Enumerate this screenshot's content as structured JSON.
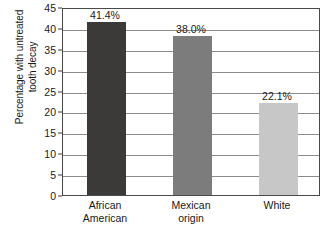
{
  "chart_data": {
    "type": "bar",
    "title": "",
    "subtitle": "",
    "xlabel": "",
    "ylabel": "Percentage with untreated tooth decay",
    "ylabel_lines": [
      "Percentage with untreated",
      "tooth decay"
    ],
    "categories": [
      "African American",
      "Mexican origin",
      "White"
    ],
    "category_lines": [
      [
        "African",
        "American"
      ],
      [
        "Mexican",
        "origin"
      ],
      [
        "White",
        ""
      ]
    ],
    "values": [
      41.4,
      38.0,
      22.1
    ],
    "data_labels": [
      "41.4%",
      "38.0%",
      "22.1%"
    ],
    "ylim": [
      0,
      45
    ],
    "ytick_step": 5,
    "ytick_labels": [
      "45",
      "40",
      "35",
      "30",
      "25",
      "20",
      "15",
      "10",
      "5",
      "0"
    ],
    "ytick_values": [
      45,
      40,
      35,
      30,
      25,
      20,
      15,
      10,
      5,
      0
    ],
    "grid": true,
    "grid_orientation": "horizontal",
    "legend": false,
    "legend_position": "none",
    "bar_colors": [
      "#3c3a38",
      "#7c7c7c",
      "#c7c7c7"
    ],
    "colors": {
      "axis": "#4a4a4a",
      "gridline": "#8c8c8c",
      "text": "#1a1a1a",
      "background": "#ffffff"
    }
  }
}
